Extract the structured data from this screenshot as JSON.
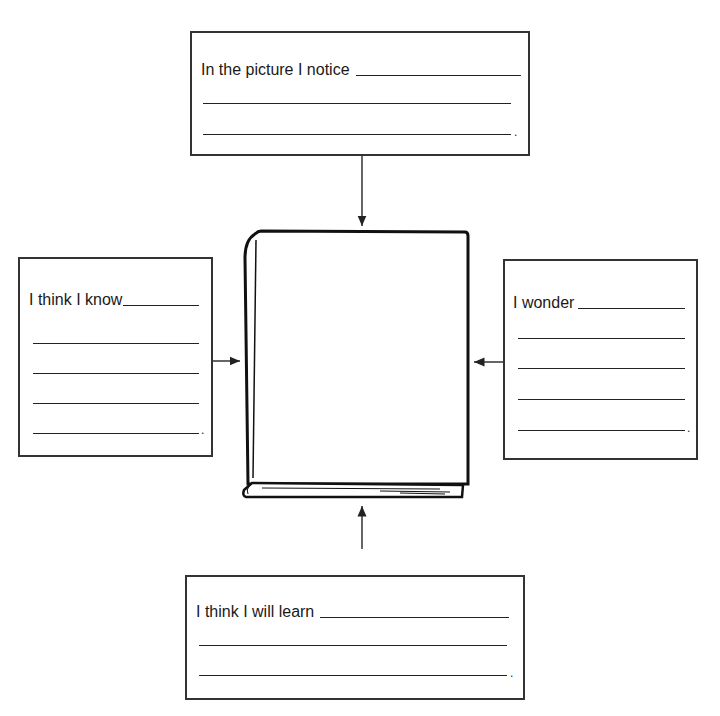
{
  "diagram": {
    "center": {
      "label": "closed book illustration"
    },
    "boxes": {
      "top": {
        "prompt": "In the picture I notice",
        "end": "."
      },
      "left": {
        "prompt": "I think I know",
        "end": "."
      },
      "right": {
        "prompt": "I wonder",
        "end": "."
      },
      "bottom": {
        "prompt": "I think I will learn",
        "end": "."
      }
    }
  }
}
